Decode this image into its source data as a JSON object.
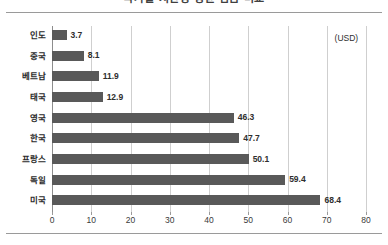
{
  "chart_data": {
    "type": "bar",
    "orientation": "horizontal",
    "title": "국가별 시간당 평균 임금 비교",
    "categories": [
      "인도",
      "중국",
      "베트남",
      "태국",
      "영국",
      "한국",
      "프랑스",
      "독일",
      "미국"
    ],
    "values": [
      3.7,
      8.1,
      11.9,
      12.9,
      46.3,
      47.7,
      50.1,
      59.4,
      68.4
    ],
    "value_labels": [
      "3.7",
      "8.1",
      "11.9",
      "12.9",
      "46.3",
      "47.7",
      "50.1",
      "59.4",
      "68.4"
    ],
    "xlabel": "",
    "ylabel": "",
    "xlim": [
      0,
      80
    ],
    "xticks": [
      0,
      10,
      20,
      30,
      40,
      50,
      60,
      70,
      80
    ],
    "xtick_labels": [
      "0",
      "10",
      "20",
      "30",
      "40",
      "50",
      "60",
      "70",
      "80"
    ],
    "grid": "vertical",
    "legend": "none",
    "annotations": [
      {
        "text": "(USD)",
        "x": 72,
        "y_category": "인도"
      }
    ],
    "bar_color": "#595959",
    "gridline_color": "#cfcfcf",
    "axis_color": "#8d8d8d",
    "text_color": "#2b2b2b",
    "background": "#ffffff"
  }
}
